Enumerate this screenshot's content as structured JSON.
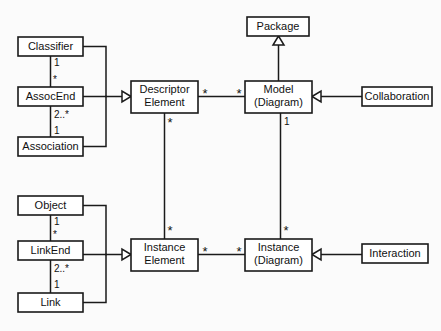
{
  "diagram": {
    "type": "uml-class-diagram",
    "colors": {
      "background": "#fbfbfb",
      "box_fill": "#ffffff",
      "line": "#1a1a1a",
      "text": "#111111"
    },
    "nodes": [
      {
        "id": "classifier",
        "label": "Classifier",
        "line2": "",
        "x": 18,
        "y": 37,
        "w": 65,
        "h": 19
      },
      {
        "id": "assocend",
        "label": "AssocEnd",
        "line2": "",
        "x": 18,
        "y": 87,
        "w": 65,
        "h": 19
      },
      {
        "id": "association",
        "label": "Association",
        "line2": "",
        "x": 18,
        "y": 137,
        "w": 65,
        "h": 19
      },
      {
        "id": "descriptor-element",
        "label": "Descriptor",
        "line2": "Element",
        "x": 131,
        "y": 81,
        "w": 67,
        "h": 32
      },
      {
        "id": "model-diagram",
        "label": "Model",
        "line2": "(Diagram)",
        "x": 245,
        "y": 81,
        "w": 67,
        "h": 32
      },
      {
        "id": "package",
        "label": "Package",
        "line2": "",
        "x": 247,
        "y": 17,
        "w": 62,
        "h": 19
      },
      {
        "id": "collaboration",
        "label": "Collaboration",
        "line2": "",
        "x": 362,
        "y": 87,
        "w": 70,
        "h": 19
      },
      {
        "id": "object",
        "label": "Object",
        "line2": "",
        "x": 18,
        "y": 196,
        "w": 65,
        "h": 19
      },
      {
        "id": "linkend",
        "label": "LinkEnd",
        "line2": "",
        "x": 18,
        "y": 241,
        "w": 65,
        "h": 19
      },
      {
        "id": "link",
        "label": "Link",
        "line2": "",
        "x": 18,
        "y": 293,
        "w": 65,
        "h": 19
      },
      {
        "id": "instance-element",
        "label": "Instance",
        "line2": "Element",
        "x": 131,
        "y": 239,
        "w": 67,
        "h": 32
      },
      {
        "id": "instance-diagram",
        "label": "Instance",
        "line2": "(Diagram)",
        "x": 245,
        "y": 239,
        "w": 67,
        "h": 32
      },
      {
        "id": "interaction",
        "label": "Interaction",
        "line2": "",
        "x": 362,
        "y": 244,
        "w": 66,
        "h": 19
      }
    ],
    "multiplicities": [
      {
        "id": "classifier-assocend-upper",
        "text": "1",
        "x": 54,
        "y": 63
      },
      {
        "id": "classifier-assocend-lower",
        "text": "*",
        "x": 54,
        "y": 79
      },
      {
        "id": "assocend-association-upper",
        "text": "2..*",
        "x": 54,
        "y": 115
      },
      {
        "id": "assocend-association-lower",
        "text": "1",
        "x": 54,
        "y": 131
      },
      {
        "id": "object-linkend-upper",
        "text": "1",
        "x": 54,
        "y": 221
      },
      {
        "id": "object-linkend-lower",
        "text": "*",
        "x": 54,
        "y": 234
      },
      {
        "id": "linkend-link-upper",
        "text": "2..*",
        "x": 54,
        "y": 268
      },
      {
        "id": "linkend-link-lower",
        "text": "1",
        "x": 54,
        "y": 285
      },
      {
        "id": "model-instance-top",
        "text": "1",
        "x": 281,
        "y": 122
      }
    ],
    "star_markers": [
      {
        "id": "descriptor-model-left",
        "x": 205,
        "y": 93
      },
      {
        "id": "descriptor-model-right",
        "x": 238,
        "y": 93
      },
      {
        "id": "descriptor-down",
        "x": 165,
        "y": 122
      },
      {
        "id": "instance-element-up",
        "x": 165,
        "y": 230
      },
      {
        "id": "instance-diagram-up",
        "x": 281,
        "y": 230
      },
      {
        "id": "instance-elem-right",
        "x": 205,
        "y": 252
      },
      {
        "id": "instance-diag-left",
        "x": 238,
        "y": 252
      }
    ],
    "relations": [
      {
        "id": "classifier-to-assocend",
        "kind": "association",
        "from": "classifier",
        "to": "assocend"
      },
      {
        "id": "assocend-to-association",
        "kind": "association",
        "from": "assocend",
        "to": "association"
      },
      {
        "id": "assocend-to-descriptor",
        "kind": "generalization",
        "from": "assocend",
        "to": "descriptor-element"
      },
      {
        "id": "classifier-to-descriptor",
        "kind": "generalization",
        "from": "classifier",
        "to": "descriptor-element"
      },
      {
        "id": "association-to-descriptor",
        "kind": "generalization",
        "from": "association",
        "to": "descriptor-element"
      },
      {
        "id": "model-to-package",
        "kind": "generalization",
        "from": "model-diagram",
        "to": "package"
      },
      {
        "id": "collaboration-to-model",
        "kind": "generalization",
        "from": "collaboration",
        "to": "model-diagram"
      },
      {
        "id": "descriptor-to-model",
        "kind": "association",
        "from": "descriptor-element",
        "to": "model-diagram"
      },
      {
        "id": "descriptor-to-instance-elem",
        "kind": "association",
        "from": "descriptor-element",
        "to": "instance-element"
      },
      {
        "id": "model-to-instance-diagram",
        "kind": "association",
        "from": "model-diagram",
        "to": "instance-diagram"
      },
      {
        "id": "object-to-linkend",
        "kind": "association",
        "from": "object",
        "to": "linkend"
      },
      {
        "id": "linkend-to-link",
        "kind": "association",
        "from": "linkend",
        "to": "link"
      },
      {
        "id": "linkend-to-instance-elem",
        "kind": "generalization",
        "from": "linkend",
        "to": "instance-element"
      },
      {
        "id": "object-to-instance-elem",
        "kind": "generalization",
        "from": "object",
        "to": "instance-element"
      },
      {
        "id": "link-to-instance-elem",
        "kind": "generalization",
        "from": "link",
        "to": "instance-element"
      },
      {
        "id": "instance-elem-to-instance-diag",
        "kind": "association",
        "from": "instance-element",
        "to": "instance-diagram"
      },
      {
        "id": "interaction-to-instance-diag",
        "kind": "generalization",
        "from": "interaction",
        "to": "instance-diagram"
      }
    ]
  }
}
